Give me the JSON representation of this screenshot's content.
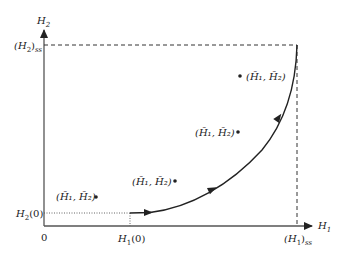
{
  "axes": {
    "x_label": "H",
    "x_label_sub": "1",
    "y_label": "H",
    "y_label_sub": "2",
    "origin_label": "0"
  },
  "ticks": {
    "h2_ss": {
      "main": "(H",
      "sub": "2",
      "tail": ")",
      "suffix": "ss"
    },
    "h2_0": {
      "main": "H",
      "sub": "2",
      "tail": "(0)"
    },
    "h1_0": {
      "main": "H",
      "sub": "1",
      "tail": "(0)"
    },
    "h1_ss": {
      "main": "(H",
      "sub": "1",
      "tail": ")",
      "suffix": "ss"
    }
  },
  "points": [
    {
      "label": "(H̄₁, H̄₂)",
      "x": 96,
      "y": 197
    },
    {
      "label": "(H̄₁, H̄₂)",
      "x": 175,
      "y": 181
    },
    {
      "label": "(H̄₁, H̄₂)",
      "x": 238,
      "y": 132
    },
    {
      "label": "(H̄₁, H̄₂)",
      "x": 240,
      "y": 76
    }
  ],
  "colors": {
    "line": "#222222",
    "background": "#ffffff"
  }
}
